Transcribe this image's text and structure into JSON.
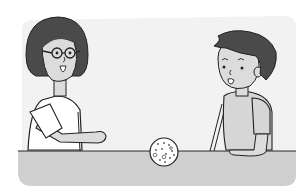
{
  "scene": {
    "description": "Illustration of a girl with glasses and a boy facing each other across a table with a small ball between them",
    "colors": {
      "background_panel": "#f2f2f2",
      "table": "#cfcfcf",
      "hair": "#4a4a4a",
      "skin": "#dcdcdc",
      "outline": "#222222",
      "shirt_girl": "#ffffff",
      "shirt_boy": "#d6d6d6"
    },
    "characters": [
      {
        "name": "girl",
        "features": [
          "bob haircut",
          "round glasses",
          "open mouth",
          "white shirt",
          "hand extended on table"
        ]
      },
      {
        "name": "boy",
        "features": [
          "short tousled hair",
          "open mouth",
          "grey t-shirt",
          "hand resting on table"
        ]
      }
    ],
    "objects": [
      {
        "name": "ball",
        "features": [
          "round",
          "speckled with dots"
        ]
      }
    ]
  }
}
